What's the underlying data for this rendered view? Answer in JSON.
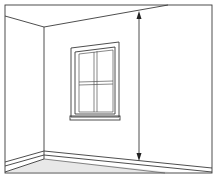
{
  "diagram": {
    "canvas": {
      "width": 215,
      "height": 176
    },
    "colors": {
      "background": "#ffffff",
      "line": "#3a3a3a",
      "floor": "#e6e6e6",
      "wall": "#ffffff"
    },
    "elements": {
      "frame": "outer-border",
      "ceiling_edge": "ceiling-line",
      "corner": "wall-corner-line",
      "window": {
        "panes": 4,
        "has_sill": true
      },
      "baseboard": "skirting-board",
      "floor": "floor-area",
      "measurement_arrow": {
        "orientation": "vertical",
        "double_headed": true,
        "measures": "wall-height"
      }
    }
  }
}
